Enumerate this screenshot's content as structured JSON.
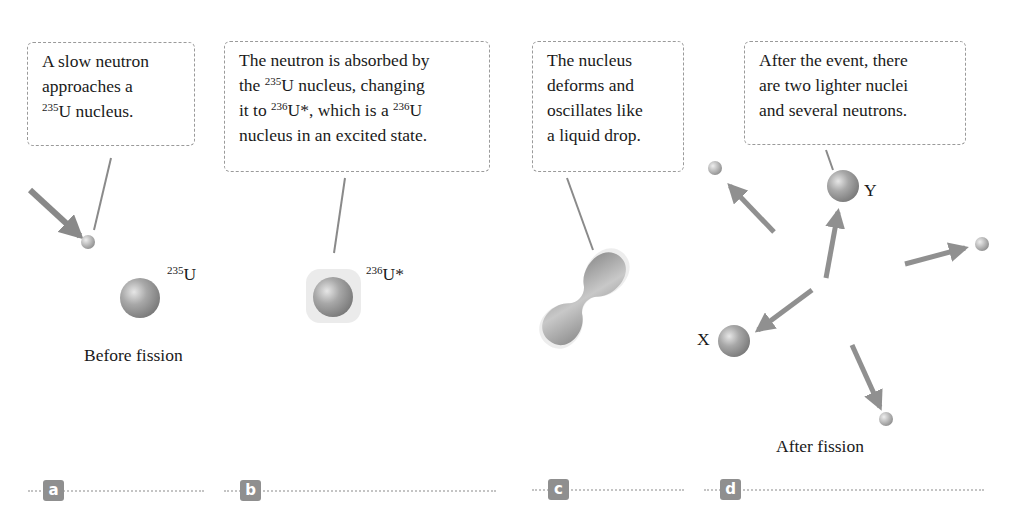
{
  "panels": [
    {
      "id": "a",
      "tag": "a",
      "callout": {
        "line1": "A slow neutron",
        "line2": "approaches a",
        "sup": "235",
        "line3_rest": "U nucleus."
      },
      "nucleus_label": {
        "sup": "235",
        "text": "U"
      },
      "caption": "Before fission"
    },
    {
      "id": "b",
      "tag": "b",
      "callout": {
        "line1": "The neutron is absorbed by",
        "line2_pre": "the ",
        "line2_sup": "235",
        "line2_post": "U nucleus, changing",
        "line3_pre": "it to ",
        "line3_sup1": "236",
        "line3_mid": "U*, which is a ",
        "line3_sup2": "236",
        "line3_post": "U",
        "line4": "nucleus in an excited state."
      },
      "nucleus_label": {
        "sup": "236",
        "text": "U*"
      }
    },
    {
      "id": "c",
      "tag": "c",
      "callout": {
        "line1": "The nucleus",
        "line2": "deforms and",
        "line3": "oscillates like",
        "line4": "a liquid drop."
      }
    },
    {
      "id": "d",
      "tag": "d",
      "callout": {
        "line1": "After the event, there",
        "line2": "are two lighter nuclei",
        "line3": "and several neutrons."
      },
      "fragment_labels": {
        "y": "Y",
        "x": "X"
      },
      "caption": "After fission"
    }
  ],
  "colors": {
    "nucleus": "#9a9a9a",
    "arrow": "#7d7d7d",
    "tag_bg": "#8f8f8f",
    "rule": "#c4c4c4",
    "callout_border": "#9a9a9a"
  }
}
